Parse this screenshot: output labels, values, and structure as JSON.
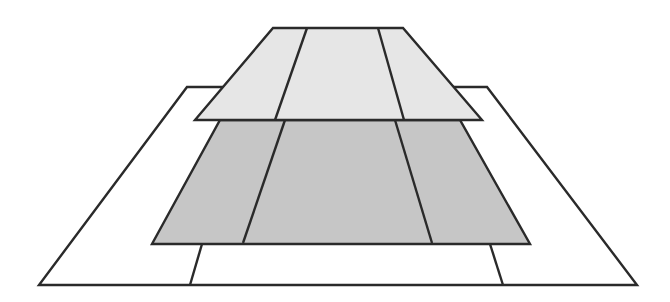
{
  "diagram": {
    "colors": {
      "stroke": "#2a2a2a",
      "background": "#ffffff",
      "bottom_layer_fill": "#ffffff",
      "middle_layer_fill": "#c6c6c6",
      "top_layer_fill": "#e6e6e6"
    },
    "layers": [
      {
        "name": "bottom-frame",
        "fill": "#ffffff",
        "outline": [
          [
            187,
            87
          ],
          [
            487,
            87
          ],
          [
            637,
            285
          ],
          [
            39,
            285
          ]
        ],
        "dividers": [
          [
            [
              202,
              244
            ],
            [
              190,
              285
            ]
          ],
          [
            [
              490,
              244
            ],
            [
              503,
              285
            ]
          ]
        ]
      },
      {
        "name": "middle-layer",
        "fill": "#c6c6c6",
        "outline": [
          [
            220,
            120
          ],
          [
            460,
            120
          ],
          [
            530,
            244
          ],
          [
            152,
            244
          ]
        ],
        "dividers": [
          [
            [
              285,
              120
            ],
            [
              243,
              243
            ]
          ],
          [
            [
              395,
              120
            ],
            [
              432,
              243
            ]
          ]
        ]
      },
      {
        "name": "top-layer",
        "fill": "#e6e6e6",
        "outline": [
          [
            273,
            28
          ],
          [
            403,
            28
          ],
          [
            482,
            120
          ],
          [
            195,
            120
          ]
        ],
        "dividers": [
          [
            [
              307,
              28
            ],
            [
              275,
              120
            ]
          ],
          [
            [
              378,
              28
            ],
            [
              404,
              120
            ]
          ]
        ]
      }
    ]
  }
}
